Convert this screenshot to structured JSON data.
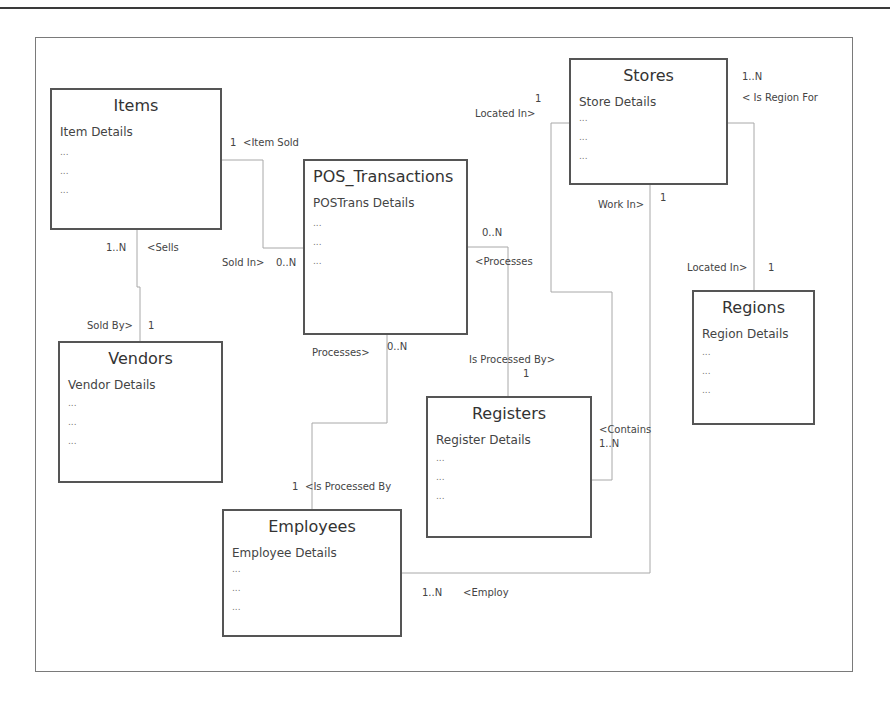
{
  "diagram": {
    "type": "entity-relationship",
    "entities": [
      {
        "id": "items",
        "name": "Items",
        "details": "Item Details",
        "rows": [
          "...",
          "...",
          "..."
        ]
      },
      {
        "id": "pos",
        "name": "POS_Transactions",
        "details": "POSTrans Details",
        "rows": [
          "...",
          "...",
          "..."
        ]
      },
      {
        "id": "stores",
        "name": "Stores",
        "details": "Store Details",
        "rows": [
          "...",
          "...",
          "..."
        ]
      },
      {
        "id": "vendors",
        "name": "Vendors",
        "details": "Vendor Details",
        "rows": [
          "...",
          "...",
          "..."
        ]
      },
      {
        "id": "regions",
        "name": "Regions",
        "details": "Region Details",
        "rows": [
          "...",
          "...",
          "..."
        ]
      },
      {
        "id": "registers",
        "name": "Registers",
        "details": "Register Details",
        "rows": [
          "...",
          "...",
          "..."
        ]
      },
      {
        "id": "employees",
        "name": "Employees",
        "details": "Employee Details",
        "rows": [
          "...",
          "...",
          "..."
        ]
      }
    ],
    "labels": {
      "items_pos_card": "1",
      "items_pos_rel": "<Item Sold",
      "pos_items_rel": "Sold In>",
      "pos_items_card": "0..N",
      "items_vendors_card": "1..N",
      "items_vendors_rel": "<Sells",
      "vendors_items_rel": "Sold By>",
      "vendors_items_card": "1",
      "stores_reg_rel": "Located In>",
      "stores_reg_card": "1",
      "stores_regions_card": "1..N",
      "stores_regions_rel": "< Is Region For",
      "regions_stores_rel": "Located In>",
      "regions_stores_card": "1",
      "stores_emp_rel": "Work In>",
      "stores_emp_card": "1",
      "pos_registers_card": "0..N",
      "pos_registers_rel": "<Processes",
      "registers_pos_rel": "Is Processed By>",
      "registers_pos_card": "1",
      "pos_emp_rel": "Processes>",
      "pos_emp_card": "0..N",
      "emp_pos_card": "1",
      "emp_pos_rel": "<Is Processed By",
      "registers_stores_rel": "<Contains",
      "registers_stores_card": "1..N",
      "emp_stores_card": "1..N",
      "emp_stores_rel": "<Employ"
    }
  }
}
